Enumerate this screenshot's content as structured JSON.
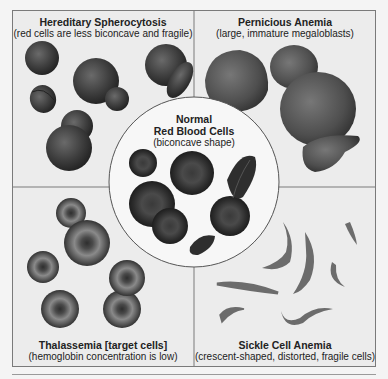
{
  "diagram": {
    "quadrants": [
      {
        "id": "hereditary-spherocytosis",
        "title": "Hereditary Spherocytosis",
        "subtitle": "(red cells are less biconcave and fragile)"
      },
      {
        "id": "pernicious-anemia",
        "title": "Pernicious Anemia",
        "subtitle": "(large, immature megaloblasts)"
      },
      {
        "id": "thalassemia",
        "title": "Thalassemia [target cells]",
        "subtitle": "(hemoglobin concentration is low)"
      },
      {
        "id": "sickle-cell-anemia",
        "title": "Sickle Cell Anemia",
        "subtitle": "(crescent-shaped, distorted, fragile cells)"
      }
    ],
    "center": {
      "title_line1": "Normal",
      "title_line2": "Red Blood Cells",
      "subtitle": "(biconcave shape)"
    },
    "colors": {
      "background": "#ececec",
      "border": "#7a7a7a",
      "cell_dark": "#3a3a3a",
      "cell_mid": "#5a5a5a",
      "sickle": "#6e6e6e",
      "circle_fill": "#f7f7f7"
    }
  }
}
